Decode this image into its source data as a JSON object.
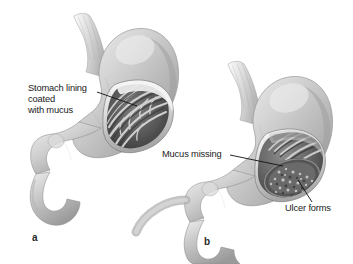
{
  "figure": {
    "type": "anatomical-illustration",
    "subject": "stomach",
    "style": "grayscale airbrush medical illustration",
    "background_color": "#ffffff",
    "text_color": "#1a1a1a"
  },
  "panels": [
    {
      "letter": "a",
      "name": "healthy-stomach",
      "description": "Stomach with intact mucus-coated lining, cutaway shows branching rugae folds",
      "annotations": [
        {
          "name": "stomach-lining-label",
          "lines": [
            "Stomach lining",
            "coated",
            "with mucus"
          ],
          "text": "Stomach lining coated with mucus"
        }
      ]
    },
    {
      "letter": "b",
      "name": "ulcerated-stomach",
      "description": "Stomach with eroded lining, cutaway shows mottled ulcer crater",
      "annotations": [
        {
          "name": "mucus-missing-label",
          "lines": [
            "Mucus missing"
          ],
          "text": "Mucus missing"
        },
        {
          "name": "ulcer-forms-label",
          "lines": [
            "Ulcer forms"
          ],
          "text": "Ulcer forms"
        }
      ]
    }
  ],
  "colors": {
    "tissue_light": "#e8e8e8",
    "tissue_mid": "#b8b8b8",
    "tissue_dark": "#8a8a8a",
    "interior_dark": "#4a4a4a",
    "outline": "#6b6b6b",
    "leader_line": "#111111"
  }
}
